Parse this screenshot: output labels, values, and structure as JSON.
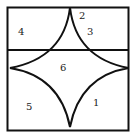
{
  "diagram": {
    "type": "geometry-figure",
    "stroke_color": "#111111",
    "background": "#ffffff",
    "labels": [
      {
        "id": "1",
        "text": "1",
        "x": 93,
        "y": 106
      },
      {
        "id": "2",
        "text": "2",
        "x": 79,
        "y": 19
      },
      {
        "id": "3",
        "text": "3",
        "x": 87,
        "y": 35
      },
      {
        "id": "4",
        "text": "4",
        "x": 18,
        "y": 35
      },
      {
        "id": "5",
        "text": "5",
        "x": 26,
        "y": 110
      },
      {
        "id": "6",
        "text": "6",
        "x": 60,
        "y": 71
      }
    ]
  }
}
